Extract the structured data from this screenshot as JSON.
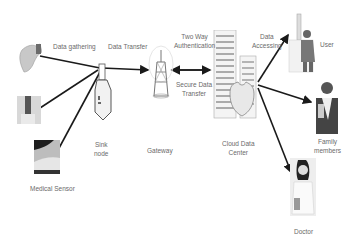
{
  "diagram": {
    "nodes": {
      "wrist_sensor": {
        "label": ""
      },
      "arm_sensor": {
        "label": ""
      },
      "foot_sensor": {
        "label": "Medical Sensor"
      },
      "sink": {
        "label_line1": "Sink",
        "label_line2": "node"
      },
      "gateway": {
        "label": "Gateway"
      },
      "cloud": {
        "label_line1": "Cloud Data",
        "label_line2": "Center"
      },
      "user": {
        "label": "User"
      },
      "family": {
        "label_line1": "Family",
        "label_line2": "members"
      },
      "doctor": {
        "label": "Doctor"
      }
    },
    "edges": {
      "data_gathering": "Data gathering",
      "data_transfer": "Data Transfer",
      "two_way_auth_line1": "Two Way",
      "two_way_auth_line2": "Authentication",
      "secure_transfer_line1": "Secure Data",
      "secure_transfer_line2": "Transfer",
      "data_accessing_line1": "Data",
      "data_accessing_line2": "Accessing"
    },
    "colors": {
      "arrow": "#1a1a1a",
      "label": "#6a6a6a",
      "building": "#9a9a9a"
    }
  }
}
